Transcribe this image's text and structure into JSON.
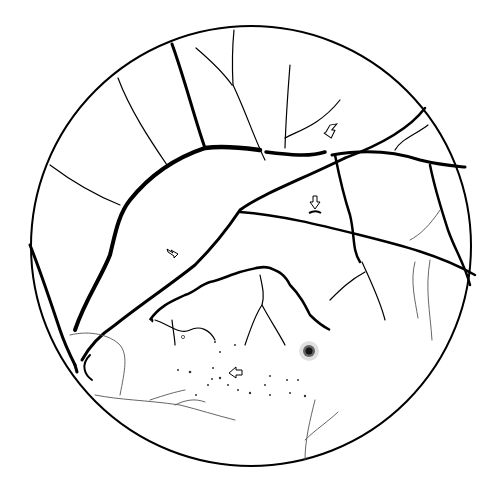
{
  "figure": {
    "type": "fundus line drawing",
    "colors": {
      "background": "#ffffff",
      "line": "#000000",
      "faint": "#555555"
    },
    "markers": [
      {
        "name": "arrow-upper-right",
        "direction": "down-left"
      },
      {
        "name": "arrow-center-right",
        "direction": "down"
      },
      {
        "name": "arrow-left",
        "direction": "down-right"
      },
      {
        "name": "arrow-lower",
        "direction": "left"
      }
    ]
  }
}
